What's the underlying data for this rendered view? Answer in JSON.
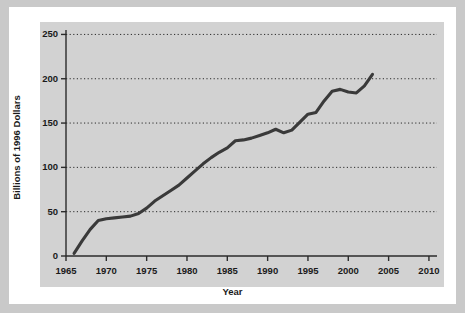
{
  "chart_data": {
    "type": "line",
    "title": "",
    "xlabel": "Year",
    "ylabel": "Billions of 1996 Dollars",
    "xlim": [
      1965,
      2011
    ],
    "ylim": [
      0,
      255
    ],
    "xticks": [
      1965,
      1970,
      1975,
      1980,
      1985,
      1990,
      1995,
      2000,
      2005,
      2010
    ],
    "yticks": [
      0,
      50,
      100,
      150,
      200,
      250
    ],
    "xtick_labels": [
      "1965",
      "1970",
      "1975",
      "1980",
      "1985",
      "1990",
      "1995",
      "2000",
      "2005",
      "2010"
    ],
    "ytick_labels": [
      "0",
      "50",
      "100",
      "150",
      "200",
      "250"
    ],
    "grid": "horizontal-dotted",
    "legend": "none",
    "line_color": "#3a3a3a",
    "panel_color": "#d2d2d2",
    "series": [
      {
        "name": "Spending",
        "x": [
          1966,
          1967,
          1968,
          1969,
          1970,
          1971,
          1972,
          1973,
          1974,
          1975,
          1976,
          1977,
          1978,
          1979,
          1980,
          1981,
          1982,
          1983,
          1984,
          1985,
          1986,
          1987,
          1988,
          1989,
          1990,
          1991,
          1992,
          1993,
          1994,
          1995,
          1996,
          1997,
          1998,
          1999,
          2000,
          2001,
          2002,
          2003
        ],
        "values": [
          3,
          17,
          30,
          40,
          42,
          43,
          44,
          45,
          48,
          54,
          62,
          68,
          74,
          80,
          88,
          96,
          104,
          111,
          117,
          122,
          130,
          131,
          133,
          136,
          139,
          143,
          139,
          142,
          151,
          160,
          162,
          175,
          186,
          188,
          185,
          184,
          192,
          205
        ]
      }
    ]
  },
  "axis": {
    "y_title": "Billions of 1996 Dollars",
    "x_title": "Year"
  }
}
